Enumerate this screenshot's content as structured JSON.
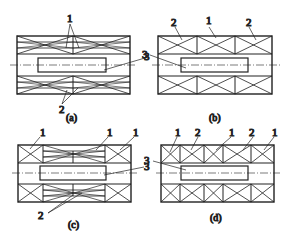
{
  "figure": {
    "panels": [
      {
        "id": "a",
        "caption": "(a)",
        "labels": [
          "1",
          "2",
          "3"
        ]
      },
      {
        "id": "b",
        "caption": "(b)",
        "labels": [
          "2",
          "1",
          "2",
          "3"
        ]
      },
      {
        "id": "c",
        "caption": "(c)",
        "labels": [
          "1",
          "1",
          "1",
          "2",
          "3"
        ]
      },
      {
        "id": "d",
        "caption": "(d)",
        "labels": [
          "1",
          "2",
          "1",
          "2",
          "1",
          "3"
        ]
      }
    ],
    "line_color": "#222222"
  }
}
